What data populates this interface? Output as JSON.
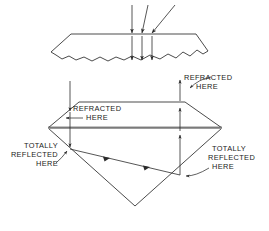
{
  "figure": {
    "background_color": "#ffffff",
    "line_color": "#2b2b2b",
    "text_color": "#1a1a1a",
    "labels": {
      "refracted_right_line1": "REFRACTED",
      "refracted_right_line2": "HERE",
      "refracted_left_line1": "REFRACTED",
      "refracted_left_line2": "HERE",
      "totally_reflected_left_line1": "TOTALLY",
      "totally_reflected_left_line2": "REFLECTED",
      "totally_reflected_left_line3": "HERE",
      "totally_reflected_right_line1": "TOTALLY",
      "totally_reflected_right_line2": "REFLECTED",
      "totally_reflected_right_line3": "HERE"
    },
    "rough_stone": {
      "name": "rough-uncut-diamond",
      "description": "Rough uncut diamond with flat sawn top and jagged irregular bottom",
      "incoming_ray_count": 3,
      "outgoing_ray_count": 3
    },
    "cut_stone": {
      "name": "cut-brilliant-diamond",
      "description": "Brilliant cut diamond showing crown, girdle and pavilion",
      "parts": [
        "crown",
        "table",
        "girdle",
        "pavilion",
        "culet"
      ],
      "entry_ray": "vertical ray entering crown facet on left",
      "exit_ray": "vertical ray exiting crown facet on right",
      "internal_bounces": 2
    }
  }
}
